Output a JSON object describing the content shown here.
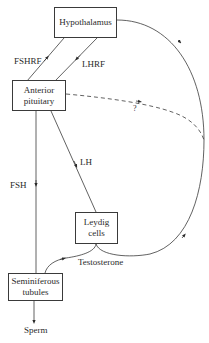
{
  "nodes": {
    "hypothalamus": {
      "label": "Hypothalamus"
    },
    "anterior_pituitary": {
      "line1": "Anterior",
      "line2": "pituitary"
    },
    "leydig_cells": {
      "line1": "Leydig",
      "line2": "cells"
    },
    "seminiferous_tubules": {
      "line1": "Seminiferous",
      "line2": "tubules"
    }
  },
  "edges": {
    "fshrf": {
      "label": "FSHRF",
      "from": "Anterior pituitary",
      "to": "Hypothalamus"
    },
    "lhrf": {
      "label": "LHRF",
      "from": "Hypothalamus",
      "to": "Anterior pituitary"
    },
    "lh": {
      "label": "LH",
      "from": "Anterior pituitary",
      "to": "Leydig cells"
    },
    "fsh": {
      "label": "FSH",
      "from": "Anterior pituitary",
      "to": "Seminiferous tubules"
    },
    "testosterone": {
      "label": "Testosterone",
      "from": "Leydig cells",
      "to": "Seminiferous tubules"
    },
    "feedback_unknown": {
      "label": "?",
      "style": "dashed",
      "from": "Anterior pituitary",
      "to": "feedback loop"
    },
    "feedback_loop": {
      "label": "",
      "from": "Leydig cells",
      "to": "Hypothalamus"
    }
  },
  "output": {
    "label": "Sperm"
  }
}
